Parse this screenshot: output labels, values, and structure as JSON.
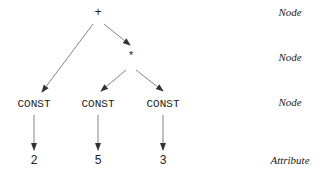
{
  "nodes": {
    "plus": "+",
    "times": "*",
    "const1": "CONST",
    "const2": "CONST",
    "const3": "CONST"
  },
  "attributes": {
    "a1": "2",
    "a2": "5",
    "a3": "3"
  },
  "level_labels": [
    "Node",
    "Node",
    "Node",
    "Attribute"
  ],
  "colors": {
    "line": "#555555",
    "text": "#222222"
  }
}
